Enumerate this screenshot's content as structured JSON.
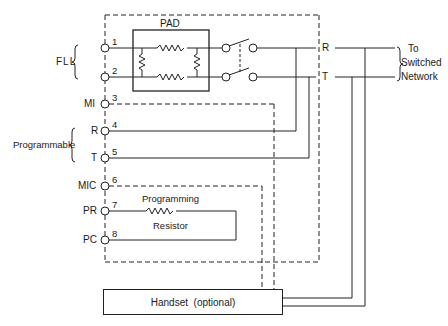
{
  "diagram": {
    "pad": {
      "label": "PAD"
    },
    "groups": {
      "fll": "FLL",
      "programmable": "Programmable"
    },
    "terminals": [
      {
        "num": "1",
        "name": ""
      },
      {
        "num": "2",
        "name": ""
      },
      {
        "num": "3",
        "name": "MI"
      },
      {
        "num": "4",
        "name": "R"
      },
      {
        "num": "5",
        "name": "T"
      },
      {
        "num": "6",
        "name": "MIC"
      },
      {
        "num": "7",
        "name": "PR"
      },
      {
        "num": "8",
        "name": "PC"
      }
    ],
    "line_labels": {
      "r": "R",
      "t": "T"
    },
    "network": {
      "line1": "To",
      "line2": "Switched",
      "line3": "Network"
    },
    "resistor": {
      "line1": "Programming",
      "line2": "Resistor"
    },
    "handset": {
      "label": "Handset  (optional)"
    },
    "colors": {
      "ink": "#1a1a1a",
      "background": "#ffffff"
    }
  }
}
